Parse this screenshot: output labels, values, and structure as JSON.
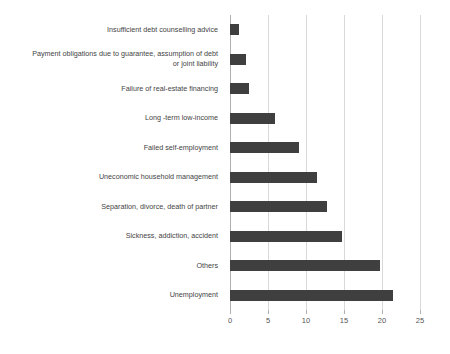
{
  "chart_data": {
    "type": "bar",
    "orientation": "horizontal",
    "title": "",
    "subtitle": "",
    "xlabel": "",
    "ylabel": "",
    "xlim": [
      0,
      25
    ],
    "ylim": null,
    "grid": true,
    "legend": null,
    "legend_position": "none",
    "bar_color": "#3f3f3f",
    "gridline_color": "#d9d9d9",
    "axis_color": "#b0b0b0",
    "xticks": [
      "0",
      "5",
      "10",
      "15",
      "20",
      "25"
    ],
    "xtick_values": [
      0,
      5,
      10,
      15,
      20,
      25
    ],
    "categories": [
      "Insufficient debt counselling advice",
      "Payment obligations due to guarantee, assumption of debt\nor joint liability",
      "Failure of real-estate financing",
      "Long -term low-income",
      "Failed self-employment",
      "Uneconomic household management",
      "Separation, divorce, death of partner",
      "Sickness, addiction, accident",
      "Others",
      "Unemployment"
    ],
    "values": [
      1.2,
      2.1,
      2.5,
      5.9,
      9.1,
      11.4,
      12.7,
      14.7,
      19.7,
      21.5
    ]
  }
}
